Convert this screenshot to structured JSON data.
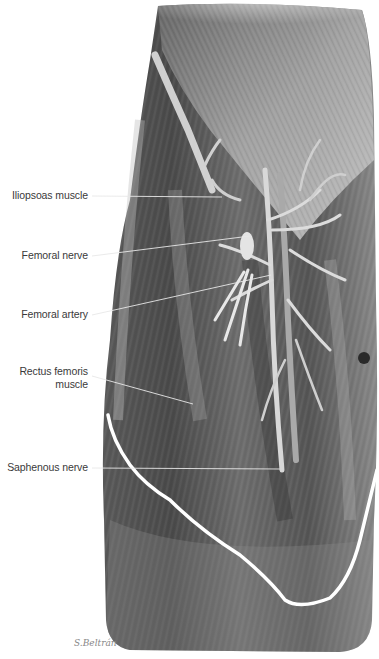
{
  "figure": {
    "signature": "S.Beltrán",
    "labels": [
      {
        "id": "iliopsoas",
        "text": "Iliopsoas muscle"
      },
      {
        "id": "femoral-nerve",
        "text": "Femoral nerve"
      },
      {
        "id": "femoral-artery",
        "text": "Femoral artery"
      },
      {
        "id": "rectus-femoris",
        "line1": "Rectus femoris",
        "line2": "muscle"
      },
      {
        "id": "saphenous-nerve",
        "text": "Saphenous nerve"
      }
    ]
  },
  "colors": {
    "background": "#ffffff",
    "label_text": "#3a3a3a",
    "leader_line": "#e8e8e8",
    "muscle_dark": "#3c3c3c",
    "muscle_mid": "#7a7a7a",
    "muscle_light": "#c9c9c9",
    "fascia_edge": "#ffffff"
  }
}
